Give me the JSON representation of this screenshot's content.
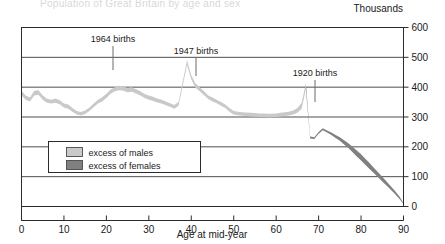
{
  "figure": {
    "cut_off_title": "Population of Great Britain by age and sex",
    "unit_label": "Thousands"
  },
  "chart_data": {
    "type": "area",
    "title": "",
    "xlabel": "Age at mid-year",
    "ylabel": "Thousands",
    "xlim": [
      0,
      90
    ],
    "ylim": [
      0,
      600
    ],
    "xticks": [
      0,
      10,
      20,
      30,
      40,
      50,
      60,
      70,
      80,
      90
    ],
    "yticks": [
      0,
      100,
      200,
      300,
      400,
      500,
      600
    ],
    "grid": true,
    "legend_position": "inside-lower-left",
    "series": [
      {
        "name": "excess of males",
        "color": "#c9c9c9",
        "band": "upper_of_population_curve"
      },
      {
        "name": "excess of females",
        "color": "#808080",
        "band": "lower_of_population_curve"
      }
    ],
    "x": [
      0,
      1,
      2,
      3,
      4,
      5,
      6,
      7,
      8,
      9,
      10,
      11,
      12,
      13,
      14,
      15,
      16,
      17,
      18,
      19,
      20,
      21,
      22,
      23,
      24,
      25,
      26,
      27,
      28,
      29,
      30,
      31,
      32,
      33,
      34,
      35,
      36,
      37,
      38,
      39,
      40,
      41,
      42,
      43,
      44,
      45,
      46,
      47,
      48,
      49,
      50,
      51,
      52,
      53,
      54,
      55,
      56,
      57,
      58,
      59,
      60,
      61,
      62,
      63,
      64,
      65,
      66,
      67,
      68,
      69,
      70,
      71,
      72,
      73,
      74,
      75,
      76,
      77,
      78,
      79,
      80,
      81,
      82,
      83,
      84,
      85,
      86,
      87,
      88,
      89,
      90
    ],
    "values_upper": [
      388,
      372,
      365,
      388,
      390,
      372,
      361,
      358,
      362,
      356,
      345,
      342,
      330,
      320,
      317,
      322,
      332,
      345,
      358,
      366,
      378,
      392,
      400,
      405,
      402,
      397,
      400,
      393,
      386,
      377,
      372,
      368,
      362,
      358,
      352,
      346,
      340,
      350,
      420,
      490,
      440,
      412,
      400,
      386,
      372,
      365,
      358,
      350,
      342,
      330,
      320,
      318,
      316,
      315,
      314,
      313,
      312,
      312,
      311,
      311,
      312,
      314,
      316,
      318,
      322,
      330,
      348,
      412,
      235,
      232,
      250,
      262,
      255,
      248,
      240,
      232,
      222,
      212,
      200,
      188,
      175,
      160,
      146,
      130,
      115,
      100,
      84,
      68,
      52,
      34,
      12
    ],
    "values_lower": [
      372,
      358,
      352,
      372,
      375,
      358,
      348,
      345,
      348,
      343,
      332,
      328,
      318,
      308,
      305,
      310,
      320,
      333,
      345,
      352,
      364,
      378,
      386,
      390,
      388,
      383,
      385,
      379,
      372,
      364,
      358,
      354,
      349,
      345,
      339,
      334,
      328,
      338,
      405,
      474,
      426,
      398,
      386,
      373,
      360,
      352,
      346,
      338,
      330,
      318,
      308,
      306,
      304,
      303,
      302,
      301,
      300,
      300,
      299,
      299,
      300,
      302,
      303,
      305,
      308,
      314,
      328,
      392,
      228,
      226,
      244,
      256,
      248,
      240,
      230,
      220,
      208,
      196,
      182,
      168,
      154,
      140,
      126,
      112,
      98,
      84,
      70,
      56,
      42,
      26,
      8
    ],
    "male_excess_start": 0,
    "male_excess_end": 67,
    "female_excess_start": 67,
    "female_excess_end": 90,
    "annotations": [
      {
        "label": "1964 births",
        "age": 21,
        "text_x": 113,
        "text_y": 42,
        "line_x": 113,
        "line_y_top": 46,
        "line_y_bottom": 70
      },
      {
        "label": "1947 births",
        "age": 38,
        "text_x": 196,
        "text_y": 54,
        "line_x": 196,
        "line_y_top": 58,
        "line_y_bottom": 76
      },
      {
        "label": "1920 births",
        "age": 66,
        "text_x": 315,
        "text_y": 76,
        "line_x": 315,
        "line_y_top": 80,
        "line_y_bottom": 102
      }
    ]
  },
  "legend": {
    "items": [
      {
        "label": "excess of males",
        "color": "#c9c9c9"
      },
      {
        "label": "excess of females",
        "color": "#808080"
      }
    ]
  }
}
